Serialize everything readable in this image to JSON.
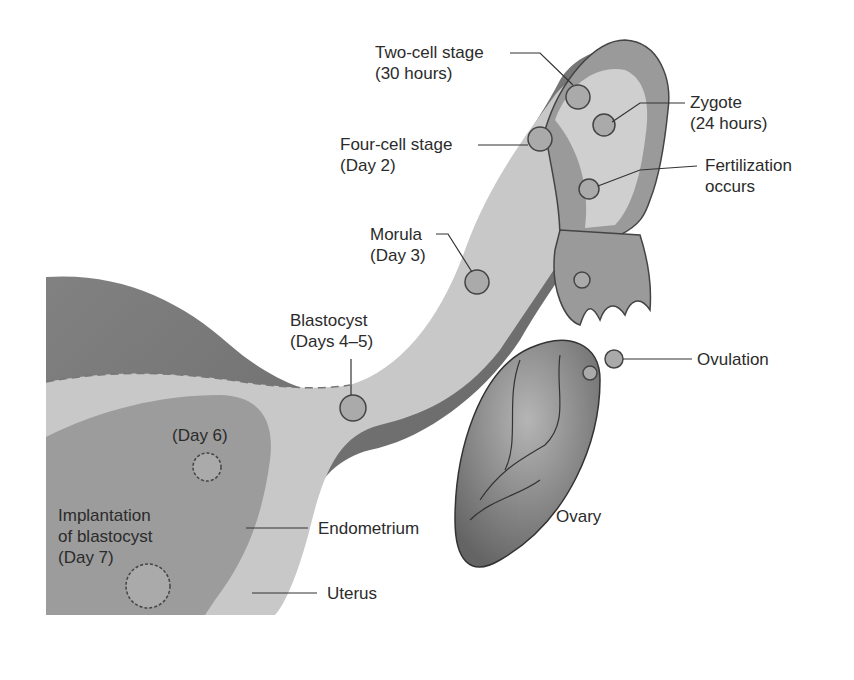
{
  "figure": {
    "colors": {
      "background": "#ffffff",
      "tissue_dark": "#6e6e6e",
      "tissue_mid": "#9a9a9a",
      "lumen": "#d4d4d4",
      "ovary": "#7a7a7a",
      "text": "#2b2b2b",
      "leader": "#333333"
    },
    "labels": {
      "two_cell": {
        "line1": "Two-cell stage",
        "line2": "(30 hours)"
      },
      "zygote": {
        "line1": "Zygote",
        "line2": "(24 hours)"
      },
      "four_cell": {
        "line1": "Four-cell stage",
        "line2": "(Day 2)"
      },
      "fertilization": {
        "line1": "Fertilization",
        "line2": "occurs"
      },
      "morula": {
        "line1": "Morula",
        "line2": "(Day 3)"
      },
      "blastocyst": {
        "line1": "Blastocyst",
        "line2": "(Days 4–5)"
      },
      "ovulation": {
        "line1": "Ovulation"
      },
      "day6": {
        "line1": "(Day 6)"
      },
      "implantation": {
        "line1": "Implantation",
        "line2": "of blastocyst",
        "line3": "(Day 7)"
      },
      "endometrium": {
        "line1": "Endometrium"
      },
      "ovary": {
        "line1": "Ovary"
      },
      "uterus": {
        "line1": "Uterus"
      }
    }
  }
}
